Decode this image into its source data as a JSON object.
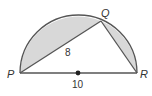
{
  "diagram": {
    "points": {
      "P": {
        "label": "P",
        "x": 20,
        "y": 73
      },
      "Q": {
        "label": "Q",
        "x": 101,
        "y": 21
      },
      "R": {
        "label": "R",
        "x": 137,
        "y": 73
      },
      "center": {
        "x": 78,
        "y": 73
      }
    },
    "segment_labels": {
      "PQ": "8",
      "PR": "10"
    },
    "colors": {
      "shade": "#d8d8d8",
      "line": "#555555",
      "text": "#333333"
    }
  }
}
